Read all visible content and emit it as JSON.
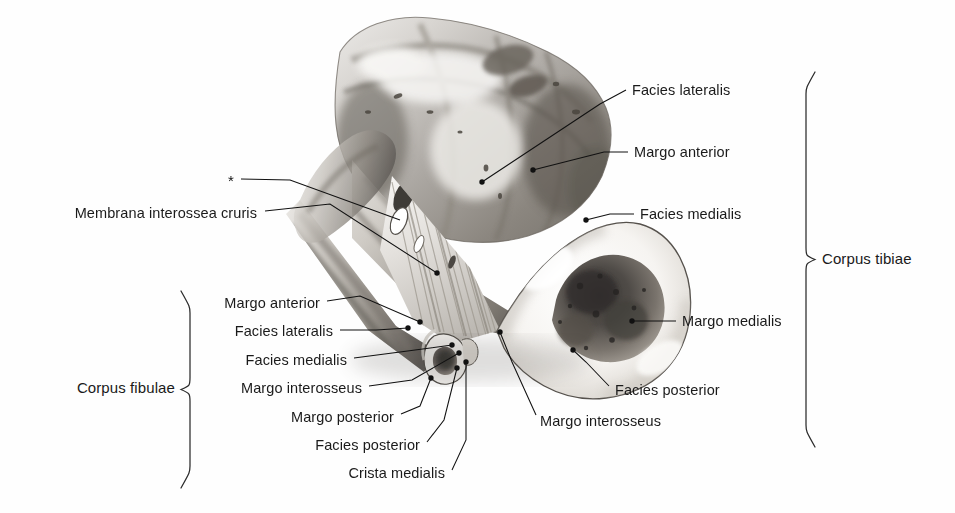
{
  "figure": {
    "kind": "anatomical-illustration",
    "background_color": "#ffffff",
    "ink_color": "#111111",
    "marker": {
      "symbol": "*",
      "x": 231,
      "y": 180
    }
  },
  "groups": [
    {
      "id": "corpus-tibiae",
      "label": "Corpus tibiae",
      "side": "right",
      "label_x": 822,
      "label_y": 258,
      "brace_x": 806,
      "brace_top": 72,
      "brace_bottom": 447
    },
    {
      "id": "corpus-fibulae",
      "label": "Corpus fibulae",
      "side": "left",
      "label_x": 175,
      "label_y": 387,
      "brace_x": 190,
      "brace_top": 291,
      "brace_bottom": 488
    }
  ],
  "labels": [
    {
      "id": "facies-lateralis-tibia",
      "text": "Facies lateralis",
      "align": "left",
      "x": 632,
      "y": 90,
      "line": "M 626 90 L 600 104 L 482 182",
      "dot": [
        482,
        182
      ]
    },
    {
      "id": "margo-anterior-tibia",
      "text": "Margo anterior",
      "align": "left",
      "x": 634,
      "y": 152,
      "line": "M 628 152 L 604 152 L 533 170",
      "dot": [
        533,
        170
      ]
    },
    {
      "id": "facies-medialis-tibia",
      "text": "Facies medialis",
      "align": "left",
      "x": 640,
      "y": 214,
      "line": "M 634 214 L 610 214 L 586 220",
      "dot": [
        586,
        220
      ]
    },
    {
      "id": "margo-medialis-tibia",
      "text": "Margo medialis",
      "align": "left",
      "x": 682,
      "y": 321,
      "line": "M 676 321 L 632 321",
      "dot": [
        632,
        321
      ]
    },
    {
      "id": "facies-posterior-tibia",
      "text": "Facies posterior",
      "align": "left",
      "x": 615,
      "y": 390,
      "line": "M 609 386 L 586 362 L 573 350",
      "dot": [
        573,
        350
      ]
    },
    {
      "id": "margo-interosseus-tibia",
      "text": "Margo interosseus",
      "align": "left",
      "x": 540,
      "y": 421,
      "line": "M 536 415 L 512 362 L 500 332",
      "dot": [
        500,
        332
      ]
    },
    {
      "id": "membrana-interossea-cruris",
      "text": "Membrana interossea cruris",
      "align": "right",
      "x": 257,
      "y": 213,
      "line": "M 265 211 L 330 204 L 437 273",
      "dot": [
        437,
        273
      ]
    },
    {
      "id": "margo-anterior-fibula",
      "text": "Margo anterior",
      "align": "right",
      "x": 320,
      "y": 303,
      "line": "M 327 301 L 360 296 L 420 322",
      "dot": [
        420,
        322
      ]
    },
    {
      "id": "facies-lateralis-fibula",
      "text": "Facies lateralis",
      "align": "right",
      "x": 333,
      "y": 331,
      "line": "M 340 330 L 376 330 L 408 328",
      "dot": [
        408,
        328
      ]
    },
    {
      "id": "facies-medialis-fibula",
      "text": "Facies medialis",
      "align": "right",
      "x": 347,
      "y": 360,
      "line": "M 354 358 L 400 352 L 452 345",
      "dot": [
        452,
        345
      ]
    },
    {
      "id": "margo-interosseus-fibula",
      "text": "Margo interosseus",
      "align": "right",
      "x": 362,
      "y": 388,
      "line": "M 369 386 L 412 380 L 459 353",
      "dot": [
        459,
        353
      ]
    },
    {
      "id": "margo-posterior-fibula",
      "text": "Margo posterior",
      "align": "right",
      "x": 394,
      "y": 417,
      "line": "M 401 414 L 420 406 L 431 378",
      "dot": [
        431,
        378
      ]
    },
    {
      "id": "facies-posterior-fibula",
      "text": "Facies posterior",
      "align": "right",
      "x": 420,
      "y": 445,
      "line": "M 427 442 L 444 420 L 457 368",
      "dot": [
        457,
        368
      ]
    },
    {
      "id": "crista-medialis-fibula",
      "text": "Crista medialis",
      "align": "right",
      "x": 445,
      "y": 473,
      "line": "M 452 470 L 466 440 L 466 362",
      "dot": [
        466,
        362
      ]
    }
  ],
  "marker_leader": {
    "line": "M 241 179 L 290 180 L 400 220"
  }
}
